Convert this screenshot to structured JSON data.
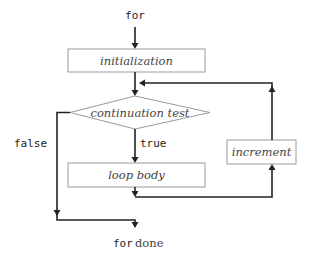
{
  "diagram": {
    "type": "flowchart",
    "start_label": "for",
    "nodes": {
      "initialization": "initialization",
      "continuation_test": "continuation test",
      "loop_body": "loop body",
      "increment": "increment"
    },
    "edges": {
      "true_label": "true",
      "false_label": "false"
    },
    "end_label": {
      "keyword": "for",
      "text": "done"
    },
    "colors": {
      "arrow": "#222222",
      "box_border": "#9a9a9a",
      "node_text": "#444444"
    }
  }
}
